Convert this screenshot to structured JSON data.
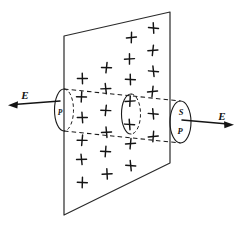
{
  "figure": {
    "background_color": "#ffffff",
    "ink_color": "#141414",
    "plane": {
      "name": "charged-plane",
      "corners": [
        [
          64.0,
          36.0
        ],
        [
          170.0,
          12.0
        ],
        [
          170.0,
          163.0
        ],
        [
          64.0,
          215.0
        ]
      ]
    },
    "charges": {
      "symbol": "+",
      "count": 25,
      "positions": [
        [
          82.0,
          78.0
        ],
        [
          82.0,
          97.0
        ],
        [
          82.0,
          118.0
        ],
        [
          82.0,
          140.0
        ],
        [
          82.0,
          159.0
        ],
        [
          106.0,
          68.0
        ],
        [
          106.0,
          89.0
        ],
        [
          106.0,
          110.0
        ],
        [
          106.0,
          132.0
        ],
        [
          106.0,
          152.0
        ],
        [
          107.0,
          174.0
        ],
        [
          82.0,
          182.0
        ],
        [
          130.0,
          59.0
        ],
        [
          130.0,
          80.0
        ],
        [
          130.0,
          101.0
        ],
        [
          130.0,
          124.0
        ],
        [
          130.0,
          144.0
        ],
        [
          131.0,
          166.0
        ],
        [
          153.0,
          50.0
        ],
        [
          153.0,
          71.0
        ],
        [
          153.0,
          92.0
        ],
        [
          153.0,
          114.0
        ],
        [
          153.0,
          136.0
        ],
        [
          154.0,
          28.0
        ],
        [
          131.0,
          38.0
        ]
      ]
    },
    "cylinder": {
      "name": "gaussian-surface",
      "left_cap": {
        "cx": 64.0,
        "cy": 110.0,
        "rx": 9.5,
        "ry": 21.0,
        "solid_side": "left",
        "hidden_side": "right"
      },
      "mid_cap": {
        "cx": 131.0,
        "cy": 114.0,
        "rx": 9.5,
        "ry": 20.0,
        "solid_side": "left",
        "hidden_side": "right"
      },
      "right_cap": {
        "cx": 180.5,
        "cy": 122.0,
        "rx": 10.5,
        "ry": 21.0,
        "solid_side": "full",
        "hidden_side": "none"
      },
      "top_rule": [
        [
          64.0,
          89.0
        ],
        [
          180.5,
          101.0
        ]
      ],
      "bottom_rule": [
        [
          64.0,
          131.0
        ],
        [
          180.5,
          143.0
        ]
      ]
    },
    "labels": [
      {
        "id": "label-E-left",
        "text": "E",
        "x": 25.0,
        "y": 96.0,
        "style": "italic-bold",
        "size": "normal"
      },
      {
        "id": "label-E-right",
        "text": "E",
        "x": 222.0,
        "y": 117.0,
        "style": "italic-bold",
        "size": "normal"
      },
      {
        "id": "label-P-left",
        "text": "P",
        "x": 60.0,
        "y": 113.0,
        "style": "italic-bold",
        "size": "tiny"
      },
      {
        "id": "label-S-right",
        "text": "S",
        "x": 181.0,
        "y": 113.0,
        "style": "italic-bold",
        "size": "small"
      },
      {
        "id": "label-P-right",
        "text": "P",
        "x": 180.0,
        "y": 132.0,
        "style": "italic-bold",
        "size": "small"
      }
    ],
    "field_arrows": [
      {
        "id": "field-arrow-left",
        "direction": "left",
        "tail": [
          60.0,
          101.0
        ],
        "tip": [
          10.0,
          105.0
        ],
        "label": "E"
      },
      {
        "id": "field-arrow-right",
        "direction": "right",
        "tail": [
          182.0,
          120.0
        ],
        "tip": [
          232.0,
          124.5
        ],
        "label": "E"
      }
    ]
  }
}
